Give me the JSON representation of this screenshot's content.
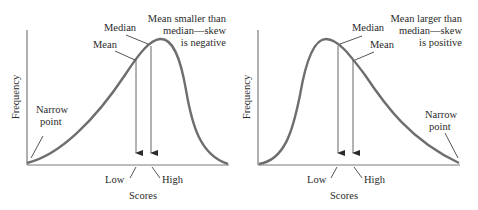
{
  "panels": [
    {
      "id": "negative-skew",
      "y_axis_label": "Frequency",
      "x_axis_label": "Scores",
      "annotation_line1": "Mean smaller than",
      "annotation_line2": "median—skew",
      "annotation_line3": "is negative",
      "median_label": "Median",
      "mean_label": "Mean",
      "narrow_label_line1": "Narrow",
      "narrow_label_line2": "point",
      "low_label": "Low",
      "high_label": "High"
    },
    {
      "id": "positive-skew",
      "y_axis_label": "Frequency",
      "x_axis_label": "Scores",
      "annotation_line1": "Mean larger than",
      "annotation_line2": "median—skew",
      "annotation_line3": "is positive",
      "median_label": "Median",
      "mean_label": "Mean",
      "narrow_label_line1": "Narrow",
      "narrow_label_line2": "point",
      "low_label": "Low",
      "high_label": "High"
    }
  ],
  "colors": {
    "curve": "#6e6e6e",
    "axis": "#7a7a7a",
    "text": "#2a2a2a"
  }
}
